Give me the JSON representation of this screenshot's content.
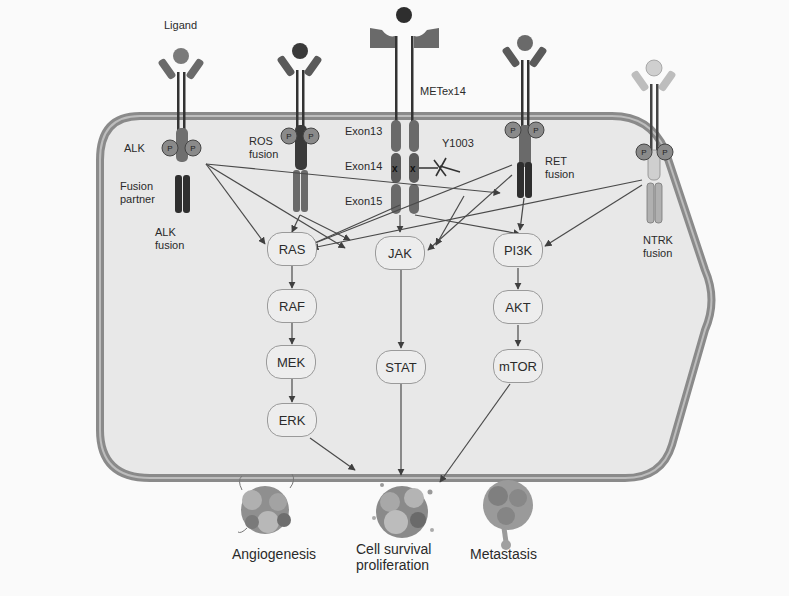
{
  "receptors": {
    "ligand_label": "Ligand",
    "alk": {
      "label": "ALK",
      "partner_label_1": "Fusion",
      "partner_label_2": "partner",
      "fusion_label_1": "ALK",
      "fusion_label_2": "fusion"
    },
    "ros": {
      "label_1": "ROS",
      "label_2": "fusion"
    },
    "met": {
      "label": "METex14",
      "exon13": "Exon13",
      "exon14": "Exon14",
      "exon15": "Exon15",
      "site": "Y1003"
    },
    "ret": {
      "label_1": "RET",
      "label_2": "fusion"
    },
    "ntrk": {
      "label_1": "NTRK",
      "label_2": "fusion"
    },
    "phospho_glyph": "P"
  },
  "nodes": {
    "ras": "RAS",
    "raf": "RAF",
    "mek": "MEK",
    "erk": "ERK",
    "jak": "JAK",
    "stat": "STAT",
    "pi3k": "PI3K",
    "akt": "AKT",
    "mtor": "mTOR"
  },
  "outcomes": {
    "angiogenesis": "Angiogenesis",
    "survival_1": "Cell survival",
    "survival_2": "proliferation",
    "metastasis": "Metastasis"
  },
  "colors": {
    "cell_fill": "#e9e9e9",
    "membrane": "#8a8a8a",
    "receptor_dark": "#3a3a3a",
    "receptor_mid": "#6a6a6a",
    "receptor_light": "#b8b8b8",
    "arrow": "#4a4a4a"
  }
}
